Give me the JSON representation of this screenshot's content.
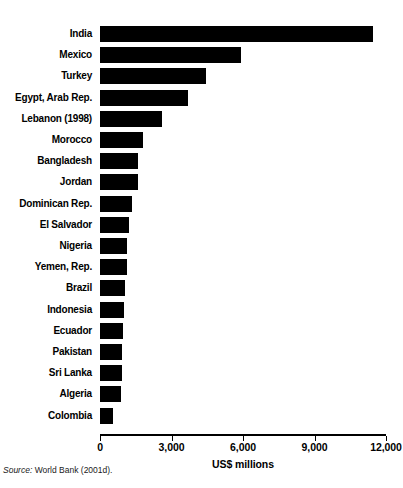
{
  "figure": {
    "title": "",
    "source_lead": "Source:",
    "source_text": " World Bank (2001d)."
  },
  "chart_data": {
    "type": "bar",
    "orientation": "horizontal",
    "title": "",
    "xlabel": "US$ millions",
    "ylabel": "",
    "xlim": [
      0,
      12000
    ],
    "xticks": [
      0,
      3000,
      6000,
      9000,
      12000
    ],
    "xticklabels": [
      "0",
      "3,000",
      "6,000",
      "9,000",
      "12,000"
    ],
    "grid": false,
    "legend": null,
    "bar_color": "#000000",
    "categories": [
      "India",
      "Mexico",
      "Turkey",
      "Egypt, Arab Rep.",
      "Lebanon (1998)",
      "Morocco",
      "Bangladesh",
      "Jordan",
      "Dominican Rep.",
      "El Salvador",
      "Nigeria",
      "Yemen, Rep.",
      "Brazil",
      "Indonesia",
      "Ecuador",
      "Pakistan",
      "Sri Lanka",
      "Algeria",
      "Colombia"
    ],
    "values": [
      11450,
      5900,
      4450,
      3700,
      2600,
      1800,
      1600,
      1580,
      1350,
      1200,
      1150,
      1120,
      1060,
      1000,
      950,
      940,
      930,
      880,
      530
    ]
  }
}
